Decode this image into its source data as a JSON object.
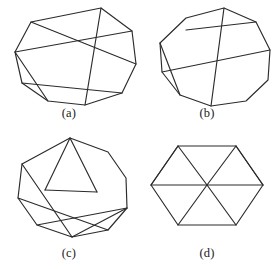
{
  "page": {
    "background_color": "#ffffff",
    "line_color": "#2b2b2b",
    "caption_color": "#1a1a1a"
  },
  "figures": [
    {
      "id": "a",
      "caption": "(a)",
      "shape_name": "nonagon-with-central-chords",
      "vertex_count": 9,
      "chord_count": 5,
      "outline_points": "101,8 132,31 136,64 122,93 85,105 48,101 22,83 15,52 31,22",
      "chords": [
        {
          "name": "chord-top-to-bottom",
          "x1": 101,
          "y1": 8,
          "x2": 85,
          "y2": 105
        },
        {
          "name": "chord-upperleft-to-right",
          "x1": 31,
          "y1": 22,
          "x2": 136,
          "y2": 64
        },
        {
          "name": "chord-left-to-upperright",
          "x1": 15,
          "y1": 52,
          "x2": 132,
          "y2": 31
        },
        {
          "name": "chord-lowerleft-to-center",
          "x1": 22,
          "y1": 83,
          "x2": 122,
          "y2": 93
        },
        {
          "name": "chord-left-lower-diagonal",
          "x1": 15,
          "y1": 52,
          "x2": 48,
          "y2": 101
        }
      ]
    },
    {
      "id": "b",
      "caption": "(b)",
      "shape_name": "decagon-with-three-chords",
      "vertex_count": 10,
      "chord_count": 3,
      "outline_points": "86,8 118,22 132,50 130,80 108,101 73,106 42,95 24,72 22,43 48,18",
      "chords": [
        {
          "name": "chord-horizontal-upper",
          "x1": 48,
          "y1": 30,
          "x2": 118,
          "y2": 22
        },
        {
          "name": "chord-long-diagonal",
          "x1": 24,
          "y1": 72,
          "x2": 132,
          "y2": 50
        },
        {
          "name": "chord-vertical-center",
          "x1": 86,
          "y1": 8,
          "x2": 73,
          "y2": 106
        },
        {
          "name": "chord-left-short",
          "x1": 22,
          "y1": 43,
          "x2": 42,
          "y2": 95
        }
      ]
    },
    {
      "id": "c",
      "caption": "(c)",
      "shape_name": "nonagon-with-zigzag-chords",
      "vertex_count": 9,
      "chord_count": 6,
      "outline_points": "70,6 108,20 126,46 127,76 108,98 72,105 37,93 18,66 22,32",
      "chords": [
        {
          "name": "chord-apex-left-v",
          "x1": 70,
          "y1": 6,
          "x2": 45,
          "y2": 58
        },
        {
          "name": "chord-apex-right-v",
          "x1": 70,
          "y1": 6,
          "x2": 97,
          "y2": 60
        },
        {
          "name": "chord-v-bottom-link",
          "x1": 45,
          "y1": 58,
          "x2": 97,
          "y2": 60
        },
        {
          "name": "chord-upperleft-cross",
          "x1": 22,
          "y1": 32,
          "x2": 72,
          "y2": 105
        },
        {
          "name": "chord-left-to-lowerright",
          "x1": 18,
          "y1": 66,
          "x2": 108,
          "y2": 98
        },
        {
          "name": "chord-right-to-bottom",
          "x1": 127,
          "y1": 76,
          "x2": 72,
          "y2": 105
        },
        {
          "name": "chord-lowerleft-to-right",
          "x1": 37,
          "y1": 93,
          "x2": 127,
          "y2": 76
        }
      ]
    },
    {
      "id": "d",
      "caption": "(d)",
      "shape_name": "hexagon-with-x-crossing",
      "vertex_count": 8,
      "chord_count": 4,
      "outline_points": "40,14 98,14 125,53 98,93 40,93 13,53",
      "chords": [
        {
          "name": "chord-topleft-to-center",
          "x1": 40,
          "y1": 14,
          "x2": 69,
          "y2": 53
        },
        {
          "name": "chord-topright-to-center",
          "x1": 98,
          "y1": 14,
          "x2": 69,
          "y2": 53
        },
        {
          "name": "chord-left-to-center",
          "x1": 13,
          "y1": 53,
          "x2": 69,
          "y2": 53
        },
        {
          "name": "chord-right-to-center",
          "x1": 125,
          "y1": 53,
          "x2": 69,
          "y2": 53
        },
        {
          "name": "chord-bottomleft-to-center",
          "x1": 40,
          "y1": 93,
          "x2": 69,
          "y2": 53
        },
        {
          "name": "chord-bottomright-to-center",
          "x1": 98,
          "y1": 93,
          "x2": 69,
          "y2": 53
        },
        {
          "name": "chord-left-upper-spoke",
          "x1": 13,
          "y1": 53,
          "x2": 40,
          "y2": 14
        },
        {
          "name": "chord-right-upper-spoke",
          "x1": 125,
          "y1": 53,
          "x2": 98,
          "y2": 14
        }
      ]
    }
  ]
}
